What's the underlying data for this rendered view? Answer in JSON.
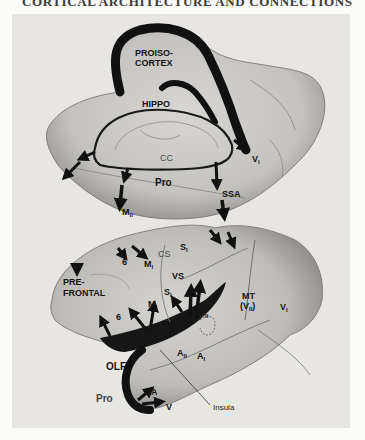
{
  "header": {
    "title": "CORTICAL ARCHITECTURE AND CONNECTIONS",
    "cropped": true
  },
  "figure": {
    "colors": {
      "background": "#e7e6e3",
      "brain_surface": "#cfcdca",
      "shading": "#8d8b88",
      "proisocortex_band": "#111111",
      "label_text": "#141414"
    },
    "medial_view": {
      "labels": {
        "proisocortex_line1": "PROISO-",
        "proisocortex_line2": "CORTEX",
        "hippo": "HIPPO",
        "cc": "CC",
        "v1_main": "V",
        "v1_sub": "I",
        "pro": "Pro",
        "ssa": "SSA",
        "m2_main": "M",
        "m2_sub": "II"
      }
    },
    "lateral_view": {
      "labels": {
        "s1_top_main": "S",
        "s1_top_sub": "I",
        "cs": "CS",
        "six_top": "6",
        "m1_top_main": "M",
        "m1_top_sub": "I",
        "prefrontal_line1": "PRE-",
        "prefrontal_line2": "FRONTAL",
        "vs": "VS",
        "s1_mid_main": "S",
        "s1_mid_sub": "I",
        "m1_mid_main": "M",
        "m1_mid_sub": "I",
        "six_mid": "6",
        "s2_main": "S",
        "s2_sub": "II",
        "mt": "MT",
        "v2_main": "(V",
        "v2_sub": "II",
        "v2_close": ")",
        "v1_main": "V",
        "v1_sub": "I",
        "g": "G",
        "a2_main": "A",
        "a2_sub": "II",
        "a1_main": "A",
        "a1_sub": "I",
        "olf": "OLF",
        "pro": "Pro",
        "a": "A",
        "v": "V",
        "insula": "Insula"
      }
    }
  }
}
